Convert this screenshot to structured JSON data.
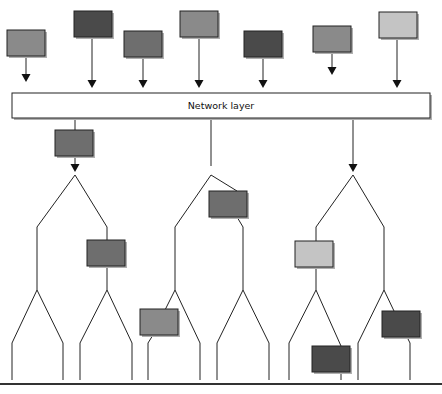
{
  "network_layer": {
    "label": "Network layer",
    "x": 12,
    "y": 93,
    "w": 179,
    "h": 25
  },
  "colors": {
    "dark": "#4a4a4a",
    "mid": "#6e6e6e",
    "medium": "#8a8a8a",
    "light": "#c4c4c4",
    "line": "#222222",
    "shadow": "#b0b0b0",
    "bottom_rule": "#333333"
  },
  "top_nodes": [
    {
      "x": 7,
      "y": 30,
      "w": 38,
      "h": 26,
      "shade": "medium",
      "arrow_x": 26,
      "arrow_end": 82
    },
    {
      "x": 74,
      "y": 11,
      "w": 38,
      "h": 26,
      "shade": "dark",
      "arrow_x": 92,
      "arrow_end": 88
    },
    {
      "x": 124,
      "y": 31,
      "w": 38,
      "h": 26,
      "shade": "mid",
      "arrow_x": 143,
      "arrow_end": 88
    },
    {
      "x": 180,
      "y": 11,
      "w": 38,
      "h": 26,
      "shade": "medium",
      "arrow_x": 199,
      "arrow_end": 88
    },
    {
      "x": 244,
      "y": 31,
      "w": 38,
      "h": 26,
      "shade": "dark",
      "arrow_x": 263,
      "arrow_end": 88
    },
    {
      "x": 313,
      "y": 26,
      "w": 38,
      "h": 26,
      "shade": "medium",
      "arrow_x": 332,
      "arrow_end": 75
    },
    {
      "x": 379,
      "y": 12,
      "w": 38,
      "h": 26,
      "shade": "light",
      "arrow_x": 397,
      "arrow_end": 88
    }
  ],
  "down_links": [
    {
      "x": 75,
      "y1": 118,
      "y2": 172
    },
    {
      "x": 211,
      "y1": 118,
      "y2": 172
    },
    {
      "x": 353,
      "y1": 118,
      "y2": 172
    }
  ],
  "tree_nodes": [
    {
      "x": 55,
      "y": 130,
      "w": 38,
      "h": 26,
      "shade": "mid"
    },
    {
      "x": 209,
      "y": 191,
      "w": 38,
      "h": 26,
      "shade": "mid"
    },
    {
      "x": 87,
      "y": 240,
      "w": 38,
      "h": 26,
      "shade": "mid"
    },
    {
      "x": 295,
      "y": 241,
      "w": 38,
      "h": 26,
      "shade": "light"
    },
    {
      "x": 140,
      "y": 309,
      "w": 38,
      "h": 26,
      "shade": "medium"
    },
    {
      "x": 382,
      "y": 311,
      "w": 38,
      "h": 26,
      "shade": "dark"
    },
    {
      "x": 312,
      "y": 346,
      "w": 38,
      "h": 26,
      "shade": "dark"
    }
  ],
  "tree_lines": [
    [
      [
        75,
        175
      ],
      [
        37,
        227
      ],
      [
        37,
        290
      ],
      [
        12,
        343
      ],
      [
        12,
        380
      ]
    ],
    [
      [
        37,
        290
      ],
      [
        63,
        343
      ],
      [
        63,
        380
      ]
    ],
    [
      [
        75,
        175
      ],
      [
        107,
        227
      ],
      [
        107,
        240
      ]
    ],
    [
      [
        107,
        266
      ],
      [
        107,
        290
      ],
      [
        80,
        343
      ],
      [
        80,
        380
      ]
    ],
    [
      [
        107,
        290
      ],
      [
        132,
        343
      ],
      [
        132,
        380
      ]
    ],
    [
      [
        211,
        175
      ],
      [
        175,
        227
      ],
      [
        175,
        290
      ],
      [
        165,
        310
      ]
    ],
    [
      [
        153,
        335
      ],
      [
        148,
        343
      ],
      [
        148,
        380
      ]
    ],
    [
      [
        175,
        290
      ],
      [
        200,
        343
      ],
      [
        200,
        380
      ]
    ],
    [
      [
        211,
        175
      ],
      [
        237,
        191
      ]
    ],
    [
      [
        237,
        217
      ],
      [
        243,
        227
      ],
      [
        243,
        290
      ],
      [
        217,
        343
      ],
      [
        217,
        380
      ]
    ],
    [
      [
        243,
        290
      ],
      [
        269,
        343
      ],
      [
        269,
        380
      ]
    ],
    [
      [
        353,
        175
      ],
      [
        316,
        227
      ],
      [
        316,
        241
      ]
    ],
    [
      [
        316,
        267
      ],
      [
        316,
        290
      ],
      [
        289,
        343
      ],
      [
        289,
        380
      ]
    ],
    [
      [
        316,
        290
      ],
      [
        341,
        346
      ]
    ],
    [
      [
        341,
        372
      ],
      [
        341,
        380
      ]
    ],
    [
      [
        353,
        175
      ],
      [
        384,
        227
      ],
      [
        384,
        290
      ],
      [
        358,
        343
      ],
      [
        358,
        380
      ]
    ],
    [
      [
        384,
        290
      ],
      [
        394,
        311
      ]
    ],
    [
      [
        407,
        337
      ],
      [
        410,
        343
      ],
      [
        410,
        380
      ]
    ]
  ],
  "tree_arrows": [
    {
      "x": 75,
      "y": 172
    },
    {
      "x": 353,
      "y": 172
    }
  ],
  "bottom_rule": {
    "y": 384
  }
}
